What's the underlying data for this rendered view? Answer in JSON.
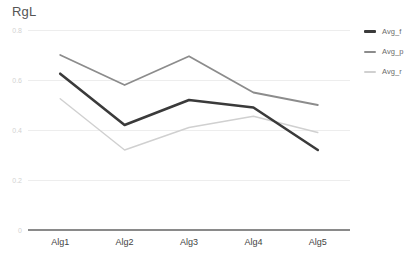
{
  "chart_data": {
    "type": "line",
    "title": "RgL",
    "xlabel": "",
    "ylabel": "",
    "categories": [
      "Alg1",
      "Alg2",
      "Alg3",
      "Alg4",
      "Alg5"
    ],
    "ylim": [
      0,
      0.8
    ],
    "yticks": [
      "0.8",
      "0.6",
      "0.4",
      "0.2",
      "0"
    ],
    "ytick_values": [
      0.8,
      0.6,
      0.4,
      0.2,
      0
    ],
    "grid": true,
    "legend_position": "right",
    "series": [
      {
        "name": "Avg_f",
        "color": "#3a3a3a",
        "width": 2.6,
        "values": [
          0.625,
          0.42,
          0.52,
          0.49,
          0.32
        ]
      },
      {
        "name": "Avg_p",
        "color": "#8c8c8c",
        "width": 1.8,
        "values": [
          0.7,
          0.58,
          0.695,
          0.55,
          0.5
        ]
      },
      {
        "name": "Avg_r",
        "color": "#d0d0d0",
        "width": 1.4,
        "values": [
          0.525,
          0.32,
          0.41,
          0.455,
          0.39
        ]
      }
    ]
  },
  "style": {
    "grid_color": "#ededed",
    "axis_color": "#8a8a8a",
    "background": "#ffffff",
    "title_color": "#555555",
    "ytick_color": "#d2d2d2",
    "xtick_color": "#444444"
  }
}
